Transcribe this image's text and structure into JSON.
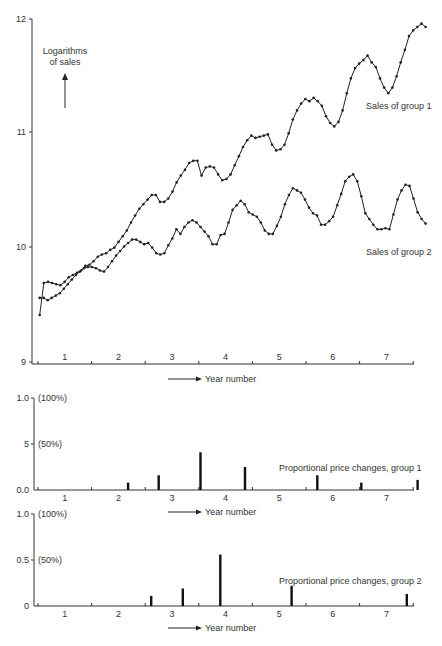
{
  "chart_data": [
    {
      "type": "line",
      "title": "",
      "ylabel": "Logarithms of sales",
      "xlabel": "Year number",
      "ylim": [
        9,
        12
      ],
      "xlim": [
        0,
        7.5
      ],
      "yticks": [
        "9",
        "10",
        "11",
        "12"
      ],
      "xtick_labels": [
        "1",
        "2",
        "3",
        "4",
        "5",
        "6",
        "7"
      ],
      "grid": false,
      "series": [
        {
          "name": "Sales of group 1",
          "x": [
            0.0,
            0.08,
            0.17,
            0.25,
            0.33,
            0.42,
            0.5,
            0.58,
            0.67,
            0.75,
            0.83,
            0.92,
            1.0,
            1.08,
            1.17,
            1.25,
            1.33,
            1.42,
            1.5,
            1.58,
            1.67,
            1.75,
            1.83,
            1.92,
            2.0,
            2.08,
            2.17,
            2.25,
            2.33,
            2.42,
            2.5,
            2.58,
            2.67,
            2.75,
            2.83,
            2.92,
            3.0,
            3.08,
            3.17,
            3.25,
            3.33,
            3.42,
            3.5,
            3.58,
            3.67,
            3.75,
            3.83,
            3.92,
            4.0,
            4.08,
            4.17,
            4.25,
            4.33,
            4.42,
            4.5,
            4.58,
            4.67,
            4.75,
            4.83,
            4.92,
            5.0,
            5.08,
            5.17,
            5.25,
            5.33,
            5.42,
            5.5,
            5.58,
            5.67,
            5.75,
            5.83,
            5.92,
            6.0,
            6.08,
            6.17,
            6.25,
            6.33,
            6.42,
            6.5,
            6.58,
            6.67,
            6.75,
            6.83,
            6.92,
            7.0
          ],
          "values": [
            9.41,
            9.69,
            9.7,
            9.69,
            9.68,
            9.67,
            9.7,
            9.74,
            9.76,
            9.78,
            9.8,
            9.84,
            9.85,
            9.88,
            9.92,
            9.94,
            9.95,
            9.98,
            10.0,
            10.05,
            10.1,
            10.15,
            10.22,
            10.28,
            10.34,
            10.38,
            10.42,
            10.46,
            10.46,
            10.4,
            10.4,
            10.43,
            10.49,
            10.57,
            10.63,
            10.68,
            10.74,
            10.76,
            10.76,
            10.63,
            10.7,
            10.71,
            10.7,
            10.64,
            10.59,
            10.6,
            10.64,
            10.72,
            10.8,
            10.88,
            10.94,
            10.98,
            10.96,
            10.97,
            10.98,
            10.99,
            10.9,
            10.85,
            10.86,
            10.9,
            11.0,
            11.12,
            11.2,
            11.26,
            11.3,
            11.28,
            11.31,
            11.28,
            11.24,
            11.15,
            11.09,
            11.06,
            11.1,
            11.2,
            11.35,
            11.48,
            11.57,
            11.61,
            11.64,
            11.68,
            11.62,
            11.58,
            11.48,
            11.4,
            11.35,
            11.4,
            11.5,
            11.62,
            11.73,
            11.85,
            11.9,
            11.93,
            11.96,
            11.93
          ]
        },
        {
          "name": "Sales of group 2",
          "x": [
            0.0,
            0.08,
            0.17,
            0.25,
            0.33,
            0.42,
            0.5,
            0.58,
            0.67,
            0.75,
            0.83,
            0.92,
            1.0,
            1.08,
            1.17,
            1.25,
            1.33,
            1.42,
            1.5,
            1.58,
            1.67,
            1.75,
            1.83,
            1.92,
            2.0,
            2.08,
            2.17,
            2.25,
            2.33,
            2.42,
            2.5,
            2.58,
            2.67,
            2.75,
            2.83,
            2.92,
            3.0,
            3.08,
            3.17,
            3.25,
            3.33,
            3.42,
            3.5,
            3.58,
            3.67,
            3.75,
            3.83,
            3.92,
            4.0,
            4.08,
            4.17,
            4.25,
            4.33,
            4.42,
            4.5,
            4.58,
            4.67,
            4.75,
            4.83,
            4.92,
            5.0,
            5.08,
            5.17,
            5.25,
            5.33,
            5.42,
            5.5,
            5.58,
            5.67,
            5.75,
            5.83,
            5.92,
            6.0,
            6.08,
            6.17,
            6.25,
            6.33,
            6.42,
            6.5,
            6.58,
            6.67,
            6.75,
            6.83,
            6.92,
            7.0
          ],
          "values": [
            9.56,
            9.56,
            9.54,
            9.56,
            9.58,
            9.6,
            9.64,
            9.68,
            9.72,
            9.76,
            9.79,
            9.82,
            9.83,
            9.83,
            9.82,
            9.8,
            9.79,
            9.83,
            9.88,
            9.93,
            9.97,
            10.01,
            10.04,
            10.07,
            10.07,
            10.05,
            10.03,
            10.04,
            10.0,
            9.95,
            9.94,
            9.95,
            10.02,
            10.08,
            10.16,
            10.12,
            10.18,
            10.22,
            10.24,
            10.22,
            10.18,
            10.14,
            10.1,
            10.03,
            10.03,
            10.11,
            10.12,
            10.22,
            10.33,
            10.37,
            10.41,
            10.38,
            10.31,
            10.29,
            10.27,
            10.22,
            10.15,
            10.12,
            10.12,
            10.19,
            10.27,
            10.38,
            10.46,
            10.52,
            10.5,
            10.48,
            10.42,
            10.35,
            10.3,
            10.28,
            10.2,
            10.2,
            10.23,
            10.27,
            10.37,
            10.47,
            10.58,
            10.62,
            10.64,
            10.58,
            10.45,
            10.3,
            10.25,
            10.2,
            10.16,
            10.16,
            10.17,
            10.16,
            10.29,
            10.42,
            10.5,
            10.55,
            10.54,
            10.43,
            10.31,
            10.25,
            10.21
          ]
        }
      ],
      "annotations": [
        "Logarithms of sales",
        "Sales of group 1",
        "Sales of group 2",
        "Year number"
      ]
    },
    {
      "type": "bar",
      "title": "Proportional price changes, group 1",
      "xlabel": "Year number",
      "ylim": [
        0,
        1.0
      ],
      "yticks": [
        "0.0",
        "5",
        "1.0"
      ],
      "ytick_pct": [
        "(50%)",
        "(100%)"
      ],
      "xtick_labels": [
        "1",
        "2",
        "3",
        "4",
        "5",
        "6",
        "7"
      ],
      "x": [
        1.7,
        2.27,
        3.05,
        3.88,
        5.23,
        6.05,
        7.1
      ],
      "values": [
        0.08,
        0.16,
        0.41,
        0.25,
        0.16,
        0.08,
        0.11
      ]
    },
    {
      "type": "bar",
      "title": "Proportional price changes, group 2",
      "xlabel": "Year number",
      "ylim": [
        0,
        1.0
      ],
      "yticks": [
        "0",
        "0.5",
        "1.0"
      ],
      "ytick_pct": [
        "(50%)",
        "(100%)"
      ],
      "xtick_labels": [
        "1",
        "2",
        "3",
        "4",
        "5",
        "6",
        "7"
      ],
      "x": [
        2.13,
        2.72,
        3.42,
        4.75,
        6.9
      ],
      "values": [
        0.11,
        0.19,
        0.56,
        0.22,
        0.13
      ]
    }
  ],
  "labels": {
    "top_ylabel_line1": "Logarithms",
    "top_ylabel_line2": "of sales",
    "series1": "Sales of group 1",
    "series2": "Sales of group 2",
    "year_number": "Year number",
    "group1_title": "Proportional price changes, group 1",
    "group2_title": "Proportional price changes, group 2",
    "y12": "12",
    "y11": "11",
    "y10": "10",
    "y9": "9",
    "g1_y100": "1.0",
    "g1_y50": "5",
    "g1_y0": "0.0",
    "g2_y100": "1.0",
    "g2_y50": "0.5",
    "g2_y0": "0",
    "pct100": "(100%)",
    "pct50": "(50%)"
  }
}
